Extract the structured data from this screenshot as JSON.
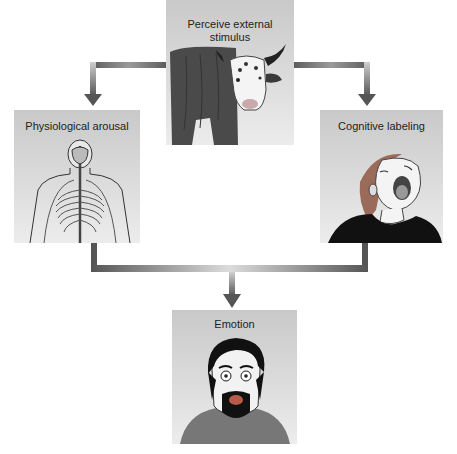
{
  "diagram": {
    "nodes": [
      {
        "id": "stimulus",
        "label": "Perceive external stimulus",
        "label_line1": "Perceive external",
        "label_line2": "stimulus",
        "image": "cow-illustration"
      },
      {
        "id": "arousal",
        "label": "Physiological arousal",
        "image": "nervous-system-illustration"
      },
      {
        "id": "labeling",
        "label": "Cognitive labeling",
        "image": "screaming-woman-illustration"
      },
      {
        "id": "emotion",
        "label": "Emotion",
        "image": "frightened-man-illustration"
      }
    ],
    "edges": [
      {
        "from": "stimulus",
        "to": "arousal"
      },
      {
        "from": "stimulus",
        "to": "labeling"
      },
      {
        "from": "arousal",
        "to": "emotion"
      },
      {
        "from": "labeling",
        "to": "emotion"
      }
    ],
    "colors": {
      "box_top": "#c9c9c9",
      "box_bottom": "#ececec",
      "arrow_dark": "#5a5a5a",
      "arrow_light": "#d8d8d8"
    }
  }
}
